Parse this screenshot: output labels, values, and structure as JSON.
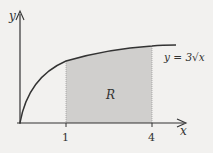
{
  "diagram": {
    "axis_x_label": "x",
    "axis_y_label": "y",
    "curve_label": "y = 3√x",
    "region_label": "R",
    "tick_1": "1",
    "tick_4": "4",
    "colors": {
      "region_fill": "#d0cfcd",
      "curve": "#333333",
      "background": "#f2f1ef"
    }
  }
}
